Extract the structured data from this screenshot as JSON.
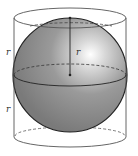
{
  "diagram": {
    "labels": {
      "upper_left_radius": "r",
      "lower_left_radius": "r",
      "sphere_radius": "r"
    },
    "colors": {
      "sphere_fill": "#8a8a8a",
      "sphere_highlight": "#ffffff",
      "outline": "#222222",
      "cylinder_line": "#555555",
      "background": "#ffffff"
    }
  }
}
